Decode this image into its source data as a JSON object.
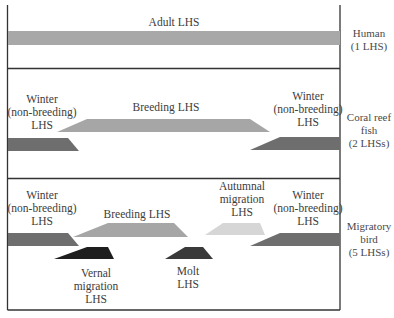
{
  "rows": [
    {
      "organism": "Human",
      "count": "(1 LHS)",
      "stages": [
        {
          "label": "Adult LHS",
          "shade": "#a8a8a8"
        }
      ]
    },
    {
      "organism_line1": "Coral reef",
      "organism_line2": "fish",
      "count": "(2 LHSs)",
      "stages": [
        {
          "line1": "Winter",
          "line2": "(non-breeding)",
          "line3": "LHS",
          "shade": "#6e6e6e"
        },
        {
          "label": "Breeding LHS",
          "shade": "#a6a6a6"
        },
        {
          "line1": "Winter",
          "line2": "(non-breeding)",
          "line3": "LHS",
          "shade": "#6e6e6e"
        }
      ]
    },
    {
      "organism_line1": "Migratory",
      "organism_line2": "bird",
      "count": "(5 LHSs)",
      "stages": [
        {
          "line1": "Winter",
          "line2": "(non-breeding)",
          "line3": "LHS",
          "shade": "#6e6e6e"
        },
        {
          "label": "Breeding LHS",
          "shade": "#a6a6a6"
        },
        {
          "line1": "Autumnal",
          "line2": "migration",
          "line3": "LHS",
          "shade": "#d6d6d6"
        },
        {
          "line1": "Winter",
          "line2": "(non-breeding)",
          "line3": "LHS",
          "shade": "#6e6e6e"
        },
        {
          "line1": "Vernal",
          "line2": "migration",
          "line3": "LHS",
          "shade": "#1e1e1e"
        },
        {
          "line1": "Molt",
          "line2": "LHS",
          "shade": "#3a3a3a"
        }
      ]
    }
  ]
}
